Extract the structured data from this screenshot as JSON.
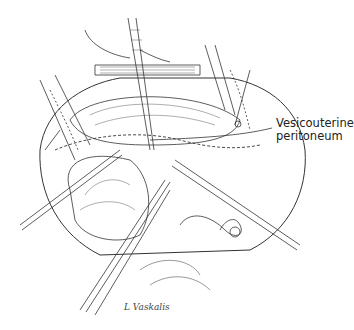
{
  "figure": {
    "labels": [
      {
        "line1": "Vesicouterine",
        "line2": "peritoneum"
      }
    ],
    "signature": "L Vaskalis",
    "colors": {
      "ink": "#222222",
      "background": "#ffffff"
    }
  }
}
